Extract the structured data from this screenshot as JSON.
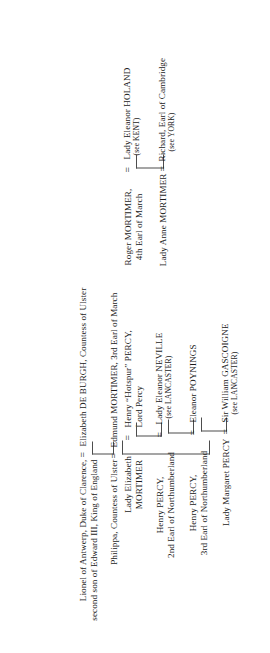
{
  "document": {
    "type": "genealogical-descent-chart",
    "orientation": "rotated-90-counterclockwise",
    "background_color": "#ffffff",
    "text_color": "#1a1a1a",
    "rule_color": "#4d4d4d"
  },
  "symbols": {
    "marriage_sign": "=",
    "marriage_sign_1": "=",
    "marriage_sign_2": "=",
    "marriage_sign_3": "=",
    "marriage_sign_4": "=",
    "marriage_sign_5": "=",
    "marriage_sign_6": "=",
    "marriage_sign_7": "="
  },
  "generations": [
    {
      "id": "gen-1",
      "husband": {
        "name_line_1": "Lionel of Antwerp, Duke of Clarence,",
        "name_line_2": "second son of Edward III, King of England"
      },
      "wife": {
        "name_line_1": "Elizabeth DE BURGH, Countess of Ulster"
      }
    },
    {
      "id": "gen-2",
      "husband": {
        "name_line_1": "Philippa, Countess of Ulster"
      },
      "wife": {
        "name_line_1": "Edmund MORTIMER, 3rd Earl of March"
      }
    }
  ],
  "mortimer_branch": [
    {
      "id": "roger-mortimer",
      "person": {
        "name_line_1": "Roger MORTIMER,",
        "name_line_2": "4th Earl of March"
      },
      "spouse": {
        "name_line_1": "Lady Eleanor HOLAND",
        "name_line_2": "(see KENT)"
      }
    },
    {
      "id": "anne-mortimer",
      "person": {
        "name_line_1": "Lady Anne MORTIMER"
      },
      "spouse": {
        "name_line_1": "Richard, Earl of Cambridge",
        "name_line_2": "(see YORK)"
      }
    }
  ],
  "percy_branch": [
    {
      "id": "elizabeth-mortimer",
      "person": {
        "name_line_1": "Lady Elizabeth",
        "name_line_2": "MORTIMER"
      },
      "spouse": {
        "name_line_1": "Henry “Hotspur” PERCY,",
        "name_line_2": "Lord Percy"
      }
    },
    {
      "id": "henry-percy-2nd",
      "person": {
        "name_line_1": "Henry PERCY,",
        "name_line_2": "2nd Earl of Northumberland"
      },
      "spouse": {
        "name_line_1": "Lady Eleanor NEVILLE",
        "name_line_2": "(see LANCASTER)"
      }
    },
    {
      "id": "henry-percy-3rd",
      "person": {
        "name_line_1": "Henry PERCY,",
        "name_line_2": "3rd Earl of Northumberland"
      },
      "spouse": {
        "name_line_1": "Eleanor POYNINGS"
      }
    },
    {
      "id": "margaret-percy",
      "person": {
        "name_line_1": "Lady Margaret PERCY"
      },
      "spouse": {
        "name_line_1": "Sir William GASCOIGNE",
        "name_line_2": "(see LANCASTER)"
      }
    }
  ]
}
